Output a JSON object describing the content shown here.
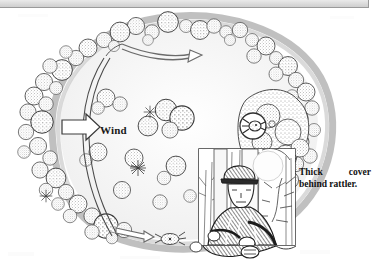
{
  "figure": {
    "kind": "plan-view-illustration",
    "medium": "scanned pen-and-ink line drawing",
    "background_color": "#ffffff",
    "ink_color": "#2b2b2b"
  },
  "chrome": {
    "top_bar_color": "#d6d6d6",
    "top_bar_border_color": "#9a9a9a"
  },
  "labels": {
    "wind": "Wind",
    "caption_line1": "Thick cover",
    "caption_line2": "behind rattler."
  },
  "annotations": {
    "wind_arrow": "hollow-block-arrow-right",
    "top_arrow": "curved-arrow-right",
    "bottom_arrow": "hollow-arrow-right",
    "turkey_symbol": "circled-turkey-icon",
    "bottom_turkey": "turkey-in-field-icon",
    "inset": "hunter-photo-inset"
  },
  "scene": {
    "field": "open clearing ringed by timber",
    "ring": "stippled tree canopies forming closed oval treeline",
    "interior_trees": "scattered individual canopies and shrubs",
    "trail": "double-line curving path on west side",
    "inset_subject": "camouflaged hunter seated against tree with shotgun"
  }
}
